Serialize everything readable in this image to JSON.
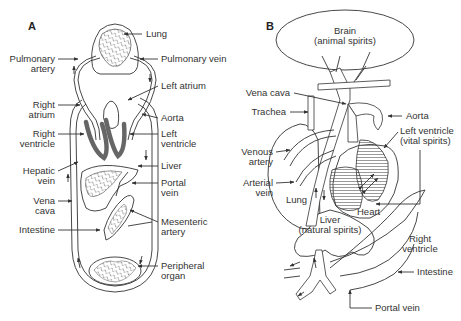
{
  "panel_a": {
    "letter": "A",
    "labels": {
      "lung": "Lung",
      "pulmonary_artery_1": "Pulmonary",
      "pulmonary_artery_2": "artery",
      "pulmonary_vein": "Pulmonary vein",
      "left_atrium": "Left atrium",
      "right_atrium_1": "Right",
      "right_atrium_2": "atrium",
      "aorta": "Aorta",
      "right_ventricle_1": "Right",
      "right_ventricle_2": "ventricle",
      "left_ventricle_1": "Left",
      "left_ventricle_2": "ventricle",
      "liver": "Liver",
      "hepatic_vein_1": "Hepatic",
      "hepatic_vein_2": "vein",
      "portal_vein_1": "Portal",
      "portal_vein_2": "vein",
      "vena_cava_1": "Vena",
      "vena_cava_2": "cava",
      "mesenteric_artery_1": "Mesenteric",
      "mesenteric_artery_2": "artery",
      "intestine": "Intestine",
      "peripheral_organ_1": "Peripheral",
      "peripheral_organ_2": "organ"
    }
  },
  "panel_b": {
    "letter": "B",
    "labels": {
      "brain_1": "Brain",
      "brain_2": "(animal spirits)",
      "vena_cava": "Vena cava",
      "trachea": "Trachea",
      "aorta": "Aorta",
      "left_ventricle_1": "Left ventricle",
      "left_ventricle_2": "(vital spirits)",
      "venous_artery_1": "Venous",
      "venous_artery_2": "artery",
      "arterial_vein_1": "Arterial",
      "arterial_vein_2": "vein",
      "lung": "Lung",
      "heart": "Heart",
      "liver_1": "Liver",
      "liver_2": "(natural spirits)",
      "right_ventricle_1": "Right",
      "right_ventricle_2": "ventricle",
      "intestine": "Intestine",
      "portal_vein": "Portal vein"
    }
  }
}
